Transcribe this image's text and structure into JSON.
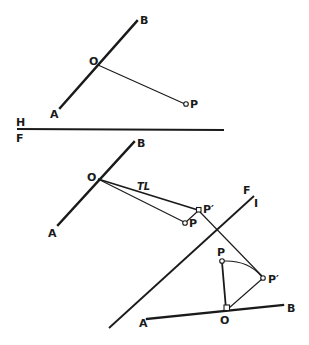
{
  "diagram": {
    "type": "descriptive-geometry-construction",
    "top_view": {
      "labels": {
        "A": "A",
        "B": "B",
        "O": "O",
        "P": "P"
      }
    },
    "fold_line_HF": {
      "upper": "H",
      "lower": "F"
    },
    "front_view": {
      "labels": {
        "A": "A",
        "B": "B",
        "O": "O",
        "P": "P",
        "P_prime": "P′",
        "true_length": "TL"
      }
    },
    "fold_line_F1": {
      "upper": "F",
      "lower": "I"
    },
    "auxiliary_view": {
      "labels": {
        "A": "A",
        "B": "B",
        "O": "O",
        "P": "P",
        "P_prime": "P′"
      }
    }
  }
}
